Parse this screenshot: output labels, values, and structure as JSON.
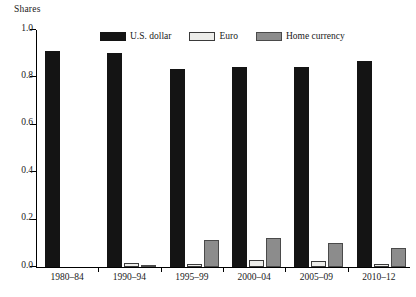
{
  "chart_data": {
    "type": "bar",
    "title": "",
    "subtitle": "",
    "xlabel": "",
    "ylabel": "Shares",
    "ylim": [
      0.0,
      1.0
    ],
    "yticks": [
      "0.0",
      "0.2",
      "0.4",
      "0.6",
      "0.8",
      "1.0"
    ],
    "ytick_values": [
      0.0,
      0.2,
      0.4,
      0.6,
      0.8,
      1.0
    ],
    "grid": false,
    "legend_position": "top-center",
    "categories": [
      "1980–84",
      "1990–94",
      "1995–99",
      "2000–04",
      "2005–09",
      "2010–12"
    ],
    "series": [
      {
        "name": "U.S. dollar",
        "color": "#141414",
        "values": [
          0.91,
          0.905,
          0.835,
          0.845,
          0.845,
          0.87
        ]
      },
      {
        "name": "Euro",
        "color": "#ededea",
        "values": [
          0.0,
          0.018,
          0.012,
          0.03,
          0.027,
          0.012
        ]
      },
      {
        "name": "Home currency",
        "color": "#8c8c8c",
        "values": [
          0.0,
          0.008,
          0.113,
          0.122,
          0.1,
          0.082
        ]
      }
    ]
  },
  "legend": {
    "items": [
      {
        "label": "U.S. dollar"
      },
      {
        "label": "Euro"
      },
      {
        "label": "Home currency"
      }
    ]
  }
}
